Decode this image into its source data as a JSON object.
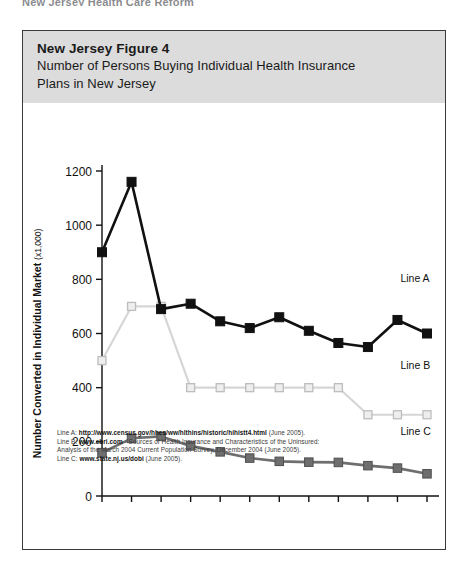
{
  "page": {
    "top_cut_text": "New Jersey Health Care Reform"
  },
  "figure": {
    "title": "New Jersey Figure 4",
    "subtitle_line1": "Number of Persons Buying Individual Health Insurance",
    "subtitle_line2": "Plans in New Jersey",
    "header_bg": "#dcdcdc",
    "border_color": "#3a3a3a"
  },
  "footnotes": [
    {
      "label": "Line A:",
      "strong": "http://www.census.gov/hhes/ww/hlthins/historic/hihistt4.html",
      "tail": "(June 2005)."
    },
    {
      "label": "Line B:",
      "strong": "www.ebri.com",
      "tail": "- Sources of Health Insurance and Characteristics of the Uninsured:"
    },
    {
      "label": "",
      "strong": "",
      "tail": "Analysis of the March 2004 Current Population Survey, December 2004  (June 2005)."
    },
    {
      "label": "Line C:",
      "strong": "www.state.nj.us/dobi",
      "tail": "(June 2005)."
    }
  ],
  "chart_data": {
    "type": "line",
    "title": "Number of Persons Buying Individual Health Insurance Plans in New Jersey",
    "xlabel": "",
    "ylabel": "Number Converted in Individual Market (x1,000)",
    "ylabel_main": "Number Converted in Individual Market",
    "ylabel_unit": "(x1,000)",
    "categories": [
      "'92",
      "'93",
      "'94",
      "'95",
      "'96",
      "'97",
      "'98",
      "'99",
      "'00",
      "'01",
      "'02",
      "'03"
    ],
    "x": [
      1992,
      1993,
      1994,
      1995,
      1996,
      1997,
      1998,
      1999,
      2000,
      2001,
      2002,
      2003
    ],
    "ylim": [
      0,
      1200
    ],
    "yticks": [
      0,
      200,
      400,
      600,
      800,
      1000,
      1200
    ],
    "grid": false,
    "legend_position": "right-inline",
    "series": [
      {
        "name": "Line A",
        "color": "#111111",
        "marker": "square-filled",
        "label_x": 2002.1,
        "label_y": 790,
        "values": [
          900,
          1160,
          690,
          710,
          645,
          620,
          660,
          610,
          565,
          550,
          650,
          600
        ]
      },
      {
        "name": "Line B",
        "color": "#d6d6d6",
        "marker": "square-open",
        "label_x": 2002.1,
        "label_y": 470,
        "values": [
          500,
          700,
          700,
          400,
          400,
          400,
          400,
          400,
          400,
          300,
          300,
          300
        ]
      },
      {
        "name": "Line C",
        "color": "#6e6e6e",
        "marker": "square-filled-gray",
        "label_x": 2002.1,
        "label_y": 225,
        "values": [
          160,
          213,
          220,
          185,
          163,
          140,
          128,
          125,
          124,
          112,
          103,
          82
        ]
      }
    ]
  }
}
